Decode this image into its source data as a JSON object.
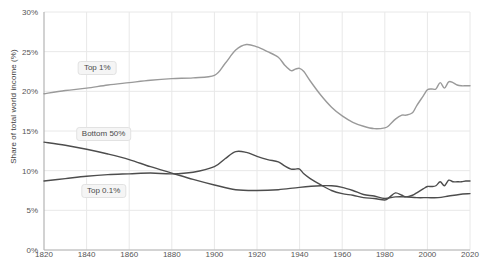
{
  "chart_data": {
    "type": "line",
    "title": "",
    "xlabel": "",
    "ylabel": "Share of total world income (%)",
    "xlim": [
      1820,
      2020
    ],
    "ylim": [
      0,
      30
    ],
    "xticks": [
      1820,
      1840,
      1860,
      1880,
      1900,
      1920,
      1940,
      1960,
      1980,
      2000,
      2020
    ],
    "xtick_labels": [
      "1820",
      "1840",
      "1860",
      "1880",
      "1900",
      "1920",
      "1940",
      "1960",
      "1980",
      "2000",
      "2020"
    ],
    "yticks": [
      0,
      5,
      10,
      15,
      20,
      25,
      30
    ],
    "ytick_labels": [
      "0%",
      "5%",
      "10%",
      "15%",
      "20%",
      "25%",
      "30%"
    ],
    "grid": true,
    "legend_position": "inline-labels",
    "series": [
      {
        "name": "Top 1%",
        "color": "#9a9a9a",
        "label_x": 1845,
        "label_y": 23.0,
        "x": [
          1820,
          1830,
          1840,
          1850,
          1860,
          1870,
          1880,
          1890,
          1900,
          1905,
          1910,
          1915,
          1920,
          1925,
          1930,
          1933,
          1936,
          1938,
          1940,
          1942,
          1945,
          1950,
          1955,
          1960,
          1965,
          1970,
          1975,
          1980,
          1982,
          1985,
          1988,
          1990,
          1993,
          1995,
          1998,
          2000,
          2002,
          2004,
          2006,
          2008,
          2010,
          2012,
          2014,
          2016,
          2018,
          2020
        ],
        "y": [
          19.7,
          20.1,
          20.4,
          20.8,
          21.1,
          21.4,
          21.6,
          21.7,
          22.0,
          23.5,
          25.2,
          25.9,
          25.6,
          25.0,
          24.3,
          23.3,
          22.6,
          22.8,
          22.9,
          22.5,
          21.3,
          19.5,
          18.0,
          16.9,
          16.1,
          15.6,
          15.3,
          15.4,
          15.7,
          16.5,
          17.0,
          17.0,
          17.3,
          18.2,
          19.4,
          20.2,
          20.3,
          20.3,
          21.1,
          20.4,
          21.2,
          21.1,
          20.8,
          20.7,
          20.7,
          20.7
        ]
      },
      {
        "name": "Bottom 50%",
        "color": "#4d4d4d",
        "label_x": 1848,
        "label_y": 14.6,
        "x": [
          1820,
          1830,
          1840,
          1850,
          1860,
          1870,
          1880,
          1890,
          1900,
          1910,
          1920,
          1930,
          1940,
          1950,
          1955,
          1960,
          1965,
          1970,
          1975,
          1980,
          1985,
          1990,
          1995,
          2000,
          2005,
          2010,
          2015,
          2020
        ],
        "y": [
          13.6,
          13.2,
          12.7,
          12.1,
          11.4,
          10.5,
          9.7,
          8.9,
          8.2,
          7.6,
          7.5,
          7.6,
          7.9,
          8.1,
          8.1,
          7.9,
          7.5,
          7.0,
          6.8,
          6.5,
          6.7,
          6.7,
          6.6,
          6.6,
          6.6,
          6.8,
          7.0,
          7.1
        ]
      },
      {
        "name": "Top 0.1%",
        "color": "#4d4d4d",
        "label_x": 1848,
        "label_y": 7.4,
        "x": [
          1820,
          1830,
          1840,
          1850,
          1860,
          1870,
          1880,
          1890,
          1900,
          1905,
          1910,
          1915,
          1920,
          1925,
          1930,
          1933,
          1936,
          1938,
          1940,
          1942,
          1945,
          1950,
          1955,
          1960,
          1965,
          1970,
          1975,
          1980,
          1982,
          1985,
          1988,
          1990,
          1993,
          1995,
          1998,
          2000,
          2002,
          2004,
          2006,
          2008,
          2010,
          2012,
          2014,
          2016,
          2018,
          2020
        ],
        "y": [
          8.7,
          9.0,
          9.3,
          9.5,
          9.6,
          9.7,
          9.6,
          9.8,
          10.5,
          11.5,
          12.4,
          12.3,
          11.8,
          11.4,
          11.1,
          10.6,
          10.2,
          10.2,
          10.2,
          9.6,
          9.0,
          8.2,
          7.5,
          7.1,
          6.9,
          6.6,
          6.5,
          6.3,
          6.6,
          7.2,
          6.9,
          6.7,
          6.9,
          7.2,
          7.7,
          8.0,
          8.0,
          8.1,
          8.6,
          8.1,
          8.8,
          8.6,
          8.6,
          8.6,
          8.7,
          8.7
        ]
      }
    ]
  }
}
